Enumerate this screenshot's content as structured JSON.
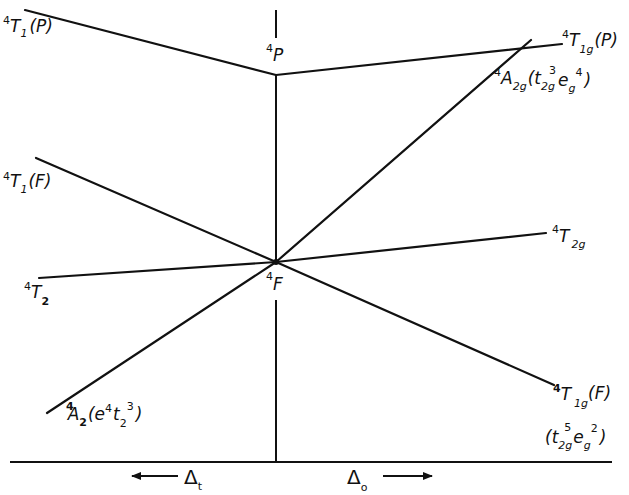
{
  "diagram": {
    "type": "Tanabe-Sugano / Orgel correlation diagram (d7 quartet terms)",
    "free_ion_terms": {
      "upper": {
        "mult": "4",
        "letter": "P"
      },
      "lower": {
        "mult": "4",
        "letter": "F"
      }
    },
    "left_side": {
      "field_label": "Δ",
      "field_sub": "t",
      "arrow": "left",
      "states": [
        {
          "id": "t1p",
          "mult": "4",
          "sym": "T",
          "sub": "1",
          "paren": "(P)"
        },
        {
          "id": "t1f",
          "mult": "4",
          "sym": "T",
          "sub": "1",
          "paren": "(F)"
        },
        {
          "id": "t2",
          "mult": "4",
          "sym": "T",
          "sub": "2",
          "paren": ""
        },
        {
          "id": "a2",
          "mult": "4",
          "sym": "A",
          "sub": "2",
          "config": "(e⁴t₂³)"
        }
      ]
    },
    "right_side": {
      "field_label": "Δ",
      "field_sub": "o",
      "arrow": "right",
      "states": [
        {
          "id": "t1gp",
          "mult": "4",
          "sym": "T",
          "sub": "1g",
          "paren": "(P)"
        },
        {
          "id": "a2g",
          "mult": "4",
          "sym": "A",
          "sub": "2g",
          "config": "(t₂g³e_g⁴)"
        },
        {
          "id": "t2g",
          "mult": "4",
          "sym": "T",
          "sub": "2g",
          "paren": ""
        },
        {
          "id": "t1gf",
          "mult": "4",
          "sym": "T",
          "sub": "1g",
          "paren": "(F)",
          "config": "(t₂g⁵e_g²)"
        }
      ]
    }
  },
  "labels": {
    "t1p": {
      "sup": "4",
      "main": "T",
      "sub": "1",
      "tail": "(P)"
    },
    "t1f": {
      "sup": "4",
      "main": "T",
      "sub": "1",
      "tail": "(F)"
    },
    "t2": {
      "sup": "4",
      "main": "T",
      "sub": "2"
    },
    "a2": {
      "sup": "4",
      "main": "A",
      "sub": "2",
      "open": "(e",
      "esup": "4",
      "t": "t",
      "tsub": "2",
      "tsup": "3",
      "close": ")"
    },
    "p": {
      "sup": "4",
      "main": "P"
    },
    "f": {
      "sup": "4",
      "main": "F"
    },
    "t1gp": {
      "sup": "4",
      "main": "T",
      "sub": "1g",
      "tail": "(P)"
    },
    "a2g": {
      "sup": "4",
      "main": "A",
      "sub": "2g",
      "open": "(t",
      "tsub": "2g",
      "tsup": "3",
      "e": "e",
      "esub": "g",
      "esup": "4",
      "close": ")"
    },
    "t2g": {
      "sup": "4",
      "main": "T",
      "sub": "2g"
    },
    "t1gf": {
      "sup": "4",
      "main": "T",
      "sub": "1g",
      "tail": "(F)"
    },
    "t1gf_config": {
      "open": "(t",
      "tsub": "2g",
      "tsup": "5",
      "e": "e",
      "esub": "g",
      "esup": "2",
      "close": ")"
    },
    "delta_t": {
      "main": "Δ",
      "sub": "t"
    },
    "delta_o": {
      "main": "Δ",
      "sub": "o"
    }
  }
}
